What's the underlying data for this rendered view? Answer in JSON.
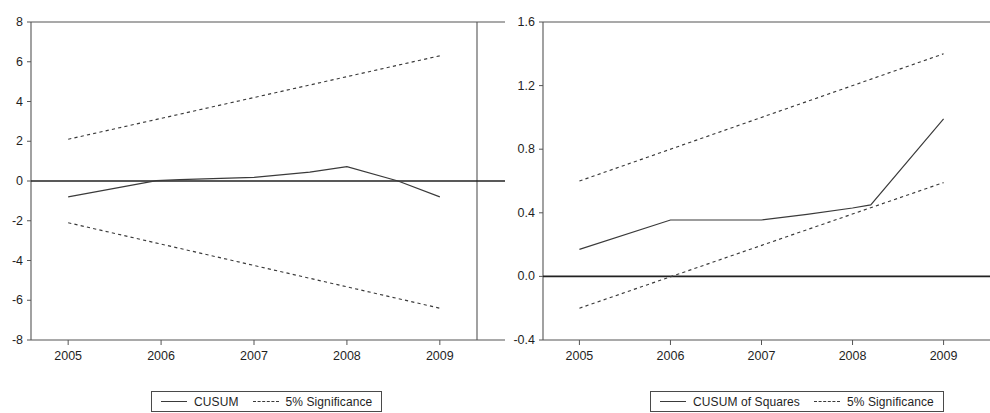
{
  "figure": {
    "background": "#ffffff",
    "line_color": "#3a3a3a",
    "axis_color": "#555555",
    "zero_line_color": "#222222"
  },
  "panels": [
    {
      "id": "cusum",
      "legend": {
        "entries": [
          {
            "label": "CUSUM",
            "style": "solid"
          },
          {
            "label": "5% Significance",
            "style": "dashed"
          }
        ]
      }
    },
    {
      "id": "cusum-of-squares",
      "legend": {
        "entries": [
          {
            "label": "CUSUM of Squares",
            "style": "solid"
          },
          {
            "label": "5% Significance",
            "style": "dashed"
          }
        ]
      }
    }
  ],
  "chart_data": [
    {
      "type": "line",
      "id": "cusum",
      "title": "",
      "xlabel": "",
      "ylabel": "",
      "grid": false,
      "legend_position": "bottom",
      "xlim": [
        2004.6,
        2009.4
      ],
      "ylim": [
        -8,
        8
      ],
      "yticks": [
        8,
        6,
        4,
        2,
        0,
        -2,
        -4,
        -6,
        -8
      ],
      "ytick_labels": [
        "8",
        "6",
        "4",
        "2",
        "0",
        "-2",
        "-4",
        "-6",
        "-8"
      ],
      "xticks": [
        2005,
        2006,
        2007,
        2008,
        2009
      ],
      "xtick_labels": [
        "2005",
        "2006",
        "2007",
        "2008",
        "2009"
      ],
      "zero_line": 0,
      "series": [
        {
          "name": "CUSUM",
          "style": "solid",
          "x": [
            2005.0,
            2005.95,
            2006.2,
            2007.0,
            2007.6,
            2008.0,
            2008.55,
            2009.0
          ],
          "values": [
            -0.8,
            0.02,
            0.07,
            0.18,
            0.45,
            0.72,
            0.0,
            -0.8
          ]
        },
        {
          "name": "5% Significance (upper)",
          "style": "dashed",
          "x": [
            2005.0,
            2009.0
          ],
          "values": [
            2.1,
            6.3
          ]
        },
        {
          "name": "5% Significance (lower)",
          "style": "dashed",
          "x": [
            2005.0,
            2009.0
          ],
          "values": [
            -2.1,
            -6.4
          ]
        }
      ]
    },
    {
      "type": "line",
      "id": "cusum-of-squares",
      "title": "",
      "xlabel": "",
      "ylabel": "",
      "grid": false,
      "legend_position": "bottom",
      "xlim": [
        2004.6,
        2009.4
      ],
      "ylim": [
        -0.4,
        1.6
      ],
      "yticks": [
        1.6,
        1.2,
        0.8,
        0.4,
        0.0,
        -0.4
      ],
      "ytick_labels": [
        "1.6",
        "1.2",
        "0.8",
        "0.4",
        "0.0",
        "-0.4"
      ],
      "xticks": [
        2005,
        2006,
        2007,
        2008,
        2009
      ],
      "xtick_labels": [
        "2005",
        "2006",
        "2007",
        "2008",
        "2009"
      ],
      "zero_line": 0.0,
      "series": [
        {
          "name": "CUSUM of Squares",
          "style": "solid",
          "x": [
            2005.0,
            2006.0,
            2007.0,
            2007.5,
            2008.0,
            2008.2,
            2009.0
          ],
          "values": [
            0.17,
            0.355,
            0.355,
            0.39,
            0.43,
            0.45,
            0.99
          ]
        },
        {
          "name": "5% Significance (upper)",
          "style": "dashed",
          "x": [
            2005.0,
            2009.0
          ],
          "values": [
            0.6,
            1.4
          ]
        },
        {
          "name": "5% Significance (lower)",
          "style": "dashed",
          "x": [
            2005.0,
            2009.0
          ],
          "values": [
            -0.2,
            0.59
          ]
        }
      ]
    }
  ]
}
